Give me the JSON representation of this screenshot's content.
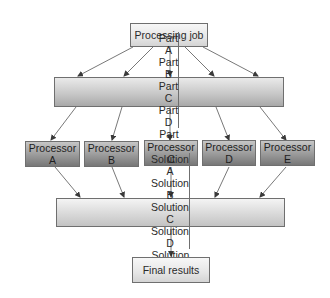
{
  "diagram": {
    "top": {
      "label": "Processing job"
    },
    "parts": [
      {
        "line1": "Part",
        "line2": "A"
      },
      {
        "line1": "Part",
        "line2": "B"
      },
      {
        "line1": "Part",
        "line2": "C"
      },
      {
        "line1": "Part",
        "line2": "D"
      },
      {
        "line1": "Part",
        "line2": "E"
      }
    ],
    "processors": [
      {
        "line1": "Processor",
        "line2": "A"
      },
      {
        "line1": "Processor",
        "line2": "B"
      },
      {
        "line1": "Processor",
        "line2": "C"
      },
      {
        "line1": "Processor",
        "line2": "D"
      },
      {
        "line1": "Processor",
        "line2": "E"
      }
    ],
    "solutions": [
      {
        "line1": "Solution",
        "line2": "A"
      },
      {
        "line1": "Solution",
        "line2": "B"
      },
      {
        "line1": "Solution",
        "line2": "C"
      },
      {
        "line1": "Solution",
        "line2": "D"
      },
      {
        "line1": "Solution",
        "line2": "E"
      }
    ],
    "final": {
      "label": "Final results"
    },
    "colors": {
      "border": "#6f6f6f",
      "arrow": "#3a3a3a",
      "processor_fill": "#9a9a9a",
      "part_fill": "#c8c8c8",
      "solution_fill": "#d9d9d9",
      "final_fill": "#e6e6e6"
    }
  }
}
